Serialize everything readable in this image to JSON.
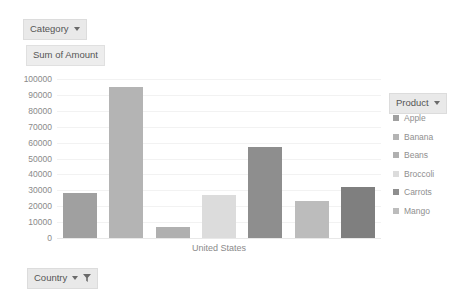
{
  "fields": {
    "category_chip": "Category",
    "measure_chip": "Sum of Amount",
    "country_chip": "Country",
    "product_chip": "Product"
  },
  "icons": {
    "caret": "chevron-down-icon",
    "funnel": "filter-funnel-icon"
  },
  "chart_data": {
    "type": "bar",
    "title": "Sum of Amount",
    "xlabel": "United States",
    "ylabel": "",
    "categories": [
      "Apple",
      "Banana",
      "Beans",
      "Broccoli",
      "Carrots",
      "Mango",
      "Mango"
    ],
    "values": [
      28500,
      95000,
      7000,
      27000,
      57000,
      23500,
      32000
    ],
    "colors": [
      "#a0a0a0",
      "#b4b4b4",
      "#b0b0b0",
      "#dcdcdc",
      "#8e8e8e",
      "#bcbcbc",
      "#7f7f7f"
    ],
    "ylim": [
      0,
      100000
    ],
    "yticks": [
      100000,
      90000,
      80000,
      70000,
      60000,
      50000,
      40000,
      30000,
      20000,
      10000,
      0
    ],
    "ytick_labels": [
      "100000",
      "90000",
      "80000",
      "70000",
      "60000",
      "50000",
      "40000",
      "30000",
      "20000",
      "10000",
      "0"
    ],
    "grid": true,
    "legend_position": "right",
    "legend": [
      {
        "label": "Apple",
        "color": "#a0a0a0"
      },
      {
        "label": "Banana",
        "color": "#b4b4b4"
      },
      {
        "label": "Beans",
        "color": "#b0b0b0"
      },
      {
        "label": "Broccoli",
        "color": "#dcdcdc"
      },
      {
        "label": "Carrots",
        "color": "#8e8e8e"
      },
      {
        "label": "Mango",
        "color": "#bcbcbc"
      }
    ]
  }
}
